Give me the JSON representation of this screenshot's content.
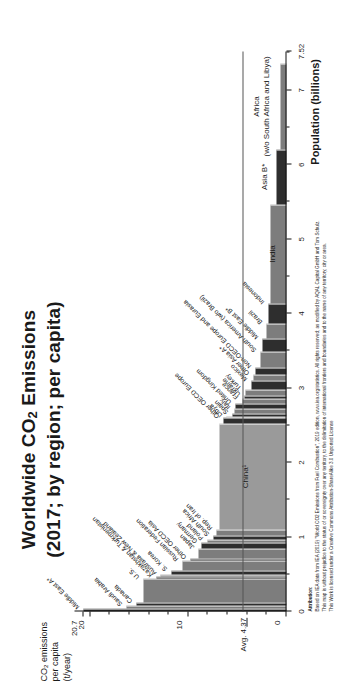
{
  "title": {
    "line1_pre": "Worldwide CO",
    "line1_sub": "2",
    "line1_post": " Emissions",
    "line2": "(2017; by region; per capita)"
  },
  "axes": {
    "y_title_l1": "CO",
    "y_title_sub": "2",
    "y_title_l1b": " emissions",
    "y_title_l2": "per capita",
    "y_title_l3": "(t/year)",
    "y_ticks": [
      "20.7",
      "20",
      "10",
      "0"
    ],
    "y_tick_values": [
      20.7,
      20,
      10,
      0
    ],
    "y_max": 21.6,
    "x_title": "Population (billions)",
    "x_ticks": [
      "0",
      "1",
      "2",
      "3",
      "4",
      "5",
      "6",
      "7",
      "7.52"
    ],
    "x_tick_values": [
      0,
      1,
      2,
      3,
      4,
      5,
      6,
      7,
      7.52
    ],
    "x_max": 7.52,
    "average_label_pre": "Avg. 4.",
    "average_label_underline": "37",
    "average_value": 4.37
  },
  "chart_data": {
    "type": "bar",
    "title": "Worldwide CO2 Emissions (2017; by region; per capita)",
    "xlabel": "Population (billions)",
    "ylabel": "CO2 emissions per capita (t/year)",
    "xlim": [
      0,
      7.52
    ],
    "ylim": [
      0,
      21.6
    ],
    "grid": false,
    "legend": "none",
    "note": "Marimekko / variable-width bar chart: bar width = population (billions), bar height = per-capita CO2 emissions (t/year). Cumulative population on x-axis.",
    "average_line": 4.37,
    "bars": [
      {
        "label": "Middle East A*",
        "population": 0.045,
        "per_capita": 20.7,
        "shade": "dark"
      },
      {
        "label": "Saudi Arabia",
        "population": 0.033,
        "per_capita": 16.3,
        "shade": "mid"
      },
      {
        "label": "Canada",
        "population": 0.037,
        "per_capita": 15.3,
        "shade": "dark"
      },
      {
        "label": "U.S.",
        "population": 0.325,
        "per_capita": 14.6,
        "shade": "mid"
      },
      {
        "label": "Kazakhstan & Turkmenistan",
        "population": 0.024,
        "per_capita": 13.2,
        "shade": "dark"
      },
      {
        "label": "Australia & New Zealand",
        "population": 0.029,
        "per_capita": 12.8,
        "shade": "mid"
      },
      {
        "label": "S. Korea",
        "population": 0.051,
        "per_capita": 11.7,
        "shade": "dark"
      },
      {
        "label": "Russian Federation",
        "population": 0.144,
        "per_capita": 10.6,
        "shade": "mid"
      },
      {
        "label": "Other OECD Asia",
        "population": 0.028,
        "per_capita": 9.8,
        "shade": "dark"
      },
      {
        "label": "Japan",
        "population": 0.127,
        "per_capita": 9.0,
        "shade": "mid"
      },
      {
        "label": "Germany",
        "population": 0.083,
        "per_capita": 8.7,
        "shade": "dark"
      },
      {
        "label": "Poland",
        "population": 0.038,
        "per_capita": 8.0,
        "shade": "mid"
      },
      {
        "label": "South Africa",
        "population": 0.057,
        "per_capita": 7.4,
        "shade": "dark"
      },
      {
        "label": "Rep. of Iran",
        "population": 0.081,
        "per_capita": 7.1,
        "shade": "mid"
      },
      {
        "label": "China¹",
        "population": 1.421,
        "per_capita": 6.8,
        "shade": "light"
      },
      {
        "label": "Other OECD Europe",
        "population": 0.086,
        "per_capita": 6.4,
        "shade": "dark"
      },
      {
        "label": "Libya",
        "population": 0.006,
        "per_capita": 6.1,
        "shade": "mid"
      },
      {
        "label": "Spain",
        "population": 0.046,
        "per_capita": 5.5,
        "shade": "dark"
      },
      {
        "label": "Italy",
        "population": 0.06,
        "per_capita": 5.3,
        "shade": "mid"
      },
      {
        "label": "United Kingdom",
        "population": 0.066,
        "per_capita": 5.2,
        "shade": "dark"
      },
      {
        "label": "France",
        "population": 0.067,
        "per_capita": 4.5,
        "shade": "mid"
      },
      {
        "label": "Ukraine",
        "population": 0.044,
        "per_capita": 4.3,
        "shade": "dark"
      },
      {
        "label": "Turkey",
        "population": 0.081,
        "per_capita": 4.2,
        "shade": "mid"
      },
      {
        "label": "Mexico",
        "population": 0.124,
        "per_capita": 3.6,
        "shade": "dark"
      },
      {
        "label": "Other Asia A*",
        "population": 0.075,
        "per_capita": 3.4,
        "shade": "mid"
      },
      {
        "label": "Non-OECD Europe and Eurasia",
        "population": 0.1,
        "per_capita": 3.2,
        "shade": "dark"
      },
      {
        "label": "South America (w/o Brazil)",
        "population": 0.214,
        "per_capita": 2.6,
        "shade": "mid"
      },
      {
        "label": "Middle East B*",
        "population": 0.168,
        "per_capita": 2.4,
        "shade": "dark"
      },
      {
        "label": "Brazil",
        "population": 0.209,
        "per_capita": 2.0,
        "shade": "mid"
      },
      {
        "label": "Indonesia",
        "population": 0.264,
        "per_capita": 1.8,
        "shade": "dark"
      },
      {
        "label": "India",
        "population": 1.339,
        "per_capita": 1.6,
        "shade": "mid"
      },
      {
        "label": "Asia B*",
        "population": 0.73,
        "per_capita": 1.0,
        "shade": "dark"
      },
      {
        "label": "Africa (w/o South Africa and Libya)",
        "population": 1.16,
        "per_capita": 0.6,
        "shade": "mid"
      }
    ]
  },
  "bar_labels": {
    "china": "China¹",
    "india": "India",
    "asia_b": "Asia B*",
    "africa_l1": "Africa",
    "africa_l2": "(w/o South Africa and Libya)"
  },
  "attribution": {
    "heading": "Attribution:",
    "line1": "Based on IEA data from IEA (2019) \"World CO2 Emissions from Fuel Combustion\", 2019 edition, www.iea.org/statistics. All rights reserved; as modified by AQAL Capital GmbH and Tom Schulz.",
    "line2": "This map is without prejudice to the status of or sovereignty over any territory, to the delimitation of international frontiers and boundaries and to the name of any territory, city or area.",
    "line3": "This Work is licensed under a Creative Commons Attribution-ShareAlike 3.0 Unported License"
  },
  "colors": {
    "light": "#9a9a9a",
    "mid": "#7d7d7d",
    "dark": "#2e2e2e",
    "axis": "#111111",
    "avg_line": "#555555"
  }
}
